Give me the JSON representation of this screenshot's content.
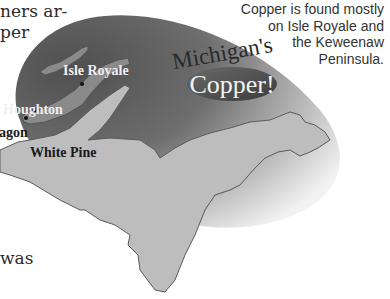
{
  "body_text": {
    "line1": "ners ar-",
    "line2": "per",
    "line3": "was"
  },
  "caption": {
    "lines": [
      "Copper is found mostly",
      "on Isle Royale and",
      "the Keweenaw",
      "Peninsula."
    ]
  },
  "title": {
    "line1": "Michigan's",
    "line2": "Copper!"
  },
  "map": {
    "labels": {
      "isle_royale": "Isle Royale",
      "houghton": "Houghton",
      "ontonagon": "agon",
      "white_pine": "White Pine"
    }
  },
  "colors": {
    "dark_gradient": "#555555",
    "light_gradient": "#d8d8d8",
    "land": "#bdbdbd",
    "copper_range": "#8a8a8a",
    "outline": "#555555",
    "title_oval": "#4a4a4a",
    "text": "#2a2a2a"
  }
}
